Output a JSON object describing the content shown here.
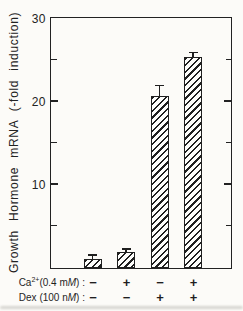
{
  "figure": {
    "background": "#fcfbf8",
    "ink": "#1f1f1f"
  },
  "chart_data": {
    "type": "bar",
    "title": "",
    "ylabel": "Growth Hormone mRNA (-fold induction)",
    "xlabel": "",
    "ylim": [
      0,
      30
    ],
    "ytick_major_values": [
      30,
      20,
      10
    ],
    "ytick_major_labels": [
      "30",
      "20",
      "10"
    ],
    "ytick_minor_values": [
      25,
      15,
      5
    ],
    "grid": "off",
    "bar_style": "diagonal-hatch",
    "values": [
      1.1,
      1.9,
      20.7,
      25.4
    ],
    "errors": [
      0.4,
      0.3,
      1.2,
      0.5
    ],
    "conditions": [
      {
        "ca": "−",
        "dex": "−"
      },
      {
        "ca": "+",
        "dex": "−"
      },
      {
        "ca": "−",
        "dex": "+"
      },
      {
        "ca": "+",
        "dex": "+"
      }
    ],
    "x_rows": [
      {
        "text_pre": "Ca",
        "sup": "2+",
        "text_mid": "(0.4 m",
        "unit": "M",
        "text_post": ") :",
        "signs": [
          "−",
          "+",
          "−",
          "+"
        ]
      },
      {
        "text_pre": "Dex",
        "sup": "",
        "text_mid": " (100 n",
        "unit": "M",
        "text_post": ") :",
        "signs": [
          "−",
          "−",
          "+",
          "+"
        ]
      }
    ]
  }
}
